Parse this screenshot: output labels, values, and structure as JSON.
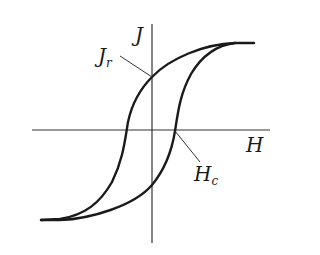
{
  "diagram": {
    "type": "magnetic-hysteresis-loop",
    "axes": {
      "x_label": "H",
      "y_label": "J"
    },
    "annotations": [
      {
        "label": "J",
        "subscript": "r",
        "meaning": "remanence"
      },
      {
        "label": "H",
        "subscript": "c",
        "meaning": "coercivity"
      }
    ],
    "colors": {
      "curve": "#1a1a1a",
      "axis": "#333333",
      "background": "#ffffff"
    }
  }
}
